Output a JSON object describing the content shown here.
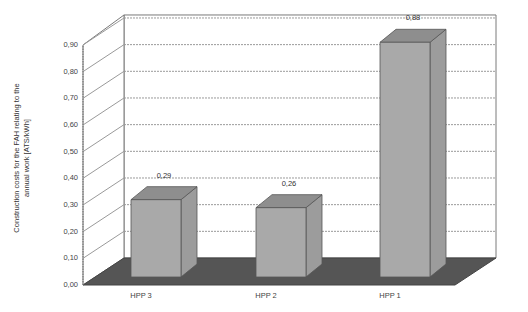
{
  "chart_data": {
    "type": "bar",
    "style": "3d-column",
    "title": "",
    "xlabel": "",
    "ylabel": "Construction costs for the FAH relating to the annual work [ATS/kWh]",
    "ylabel_lines": [
      "Construction costs for the FAH relating to the",
      "annual work [ATS/kWh]"
    ],
    "categories": [
      "HPP 3",
      "HPP 2",
      "HPP 1"
    ],
    "values": [
      0.29,
      0.26,
      0.88
    ],
    "value_labels": [
      "0,29",
      "0,26",
      "0,88"
    ],
    "ylim": [
      0,
      0.9
    ],
    "yticks": [
      0.0,
      0.1,
      0.2,
      0.3,
      0.4,
      0.5,
      0.6,
      0.7,
      0.8,
      0.9
    ],
    "ytick_labels": [
      "0,00",
      "0,10",
      "0,20",
      "0,30",
      "0,40",
      "0,50",
      "0,60",
      "0,70",
      "0,80",
      "0,90"
    ],
    "grid": true,
    "legend": null,
    "colors": {
      "bar_front": "#a9a9a9",
      "bar_top": "#8e8e8e",
      "bar_side": "#9c9c9c",
      "floor": "#555555",
      "grid": "#9a9a9a",
      "frame": "#7a7a7a"
    }
  }
}
